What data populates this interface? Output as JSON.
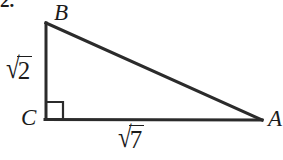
{
  "problem": {
    "number": "2."
  },
  "figure": {
    "vertices": [
      {
        "name": "B",
        "label": "B",
        "x": 46,
        "y": 23
      },
      {
        "name": "C",
        "label": "C",
        "x": 46,
        "y": 119
      },
      {
        "name": "A",
        "label": "A",
        "x": 262,
        "y": 120
      }
    ],
    "sides": [
      {
        "name": "leg-BC",
        "label": "√2",
        "radical_sign": "√",
        "radicand": "2"
      },
      {
        "name": "leg-CA",
        "label": "√7",
        "radical_sign": "√",
        "radicand": "7"
      },
      {
        "name": "hypotenuse-BA",
        "label": ""
      }
    ],
    "right_angle_at": "C",
    "colors": {
      "stroke": "#2b2b2b",
      "text": "#1b1b1b",
      "background": "#ffffff"
    },
    "stroke_width": 3,
    "right_angle_marker_size": 17
  }
}
